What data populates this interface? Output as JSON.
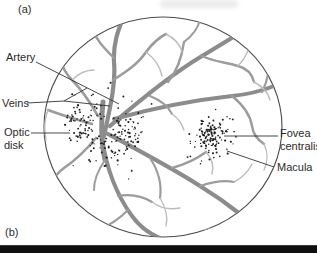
{
  "figure": {
    "panel_a_label": "(a)",
    "panel_b_label": "(b)"
  },
  "annotations": {
    "artery": "Artery",
    "veins": "Veins",
    "optic_disk": "Optic disk",
    "fovea_centralis": "Fovea centralis",
    "macula": "Macula"
  },
  "colors": {
    "background": "#ffffff",
    "text": "#2b2b2b",
    "outline": "#4a4a4a",
    "vessel_primary": "#8c8c8c",
    "vessel_secondary": "#9c9c9c",
    "vessel_fine": "#bcbcbc",
    "stipple": "#1f1f1f",
    "leader_line": "#333333",
    "divider_bar": "#0f0f0f"
  }
}
